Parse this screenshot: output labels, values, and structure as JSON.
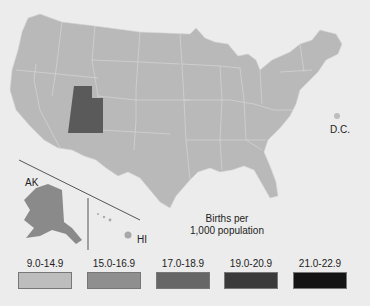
{
  "map": {
    "labels": {
      "ak": "AK",
      "hi": "HI",
      "dc": "D.C."
    },
    "note_line1": "Births per",
    "note_line2": "1,000 population",
    "highlighted_state": "Utah",
    "base_color": "#b9b9b9",
    "highlight_color": "#5a5a5a"
  },
  "legend": [
    {
      "label": "9.0-14.9",
      "color": "#bdbdbd"
    },
    {
      "label": "15.0-16.9",
      "color": "#8f8f8f"
    },
    {
      "label": "17.0-18.9",
      "color": "#666666"
    },
    {
      "label": "19.0-20.9",
      "color": "#3a3a3a"
    },
    {
      "label": "21.0-22.9",
      "color": "#141414"
    }
  ]
}
